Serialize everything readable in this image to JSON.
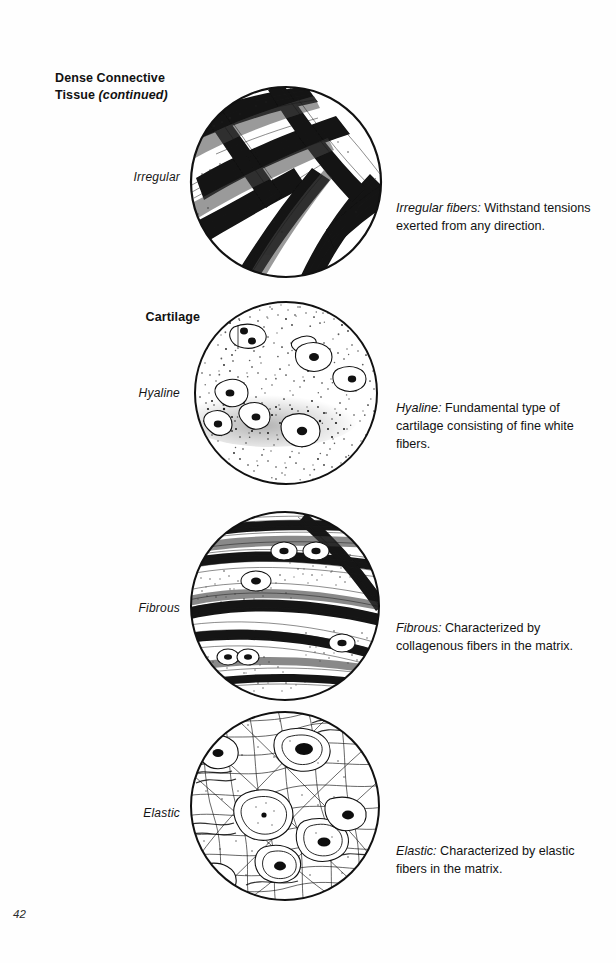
{
  "page": {
    "number": "42",
    "background_color": "#fefefe",
    "ink_color": "#111111"
  },
  "headings": {
    "section_line1": "Dense Connective",
    "section_line2": "Tissue",
    "section_continued": "(continued)",
    "subsection": "Cartilage"
  },
  "rows": [
    {
      "label": "Irregular",
      "figure_name": "irregular-dense-connective-tissue-micrograph",
      "caption_term": "Irregular fibers:",
      "caption_text": " Withstand tensions exerted from any direction."
    },
    {
      "label": "Hyaline",
      "figure_name": "hyaline-cartilage-micrograph",
      "caption_term": "Hyaline:",
      "caption_text": " Fundamental type of cartilage consisting of fine white fibers."
    },
    {
      "label": "Fibrous",
      "figure_name": "fibrous-cartilage-micrograph",
      "caption_term": "Fibrous:",
      "caption_text": " Characterized by collagenous fibers in the matrix."
    },
    {
      "label": "Elastic",
      "figure_name": "elastic-cartilage-micrograph",
      "caption_term": "Elastic:",
      "caption_text": " Characterized by elastic fibers in the matrix."
    }
  ]
}
